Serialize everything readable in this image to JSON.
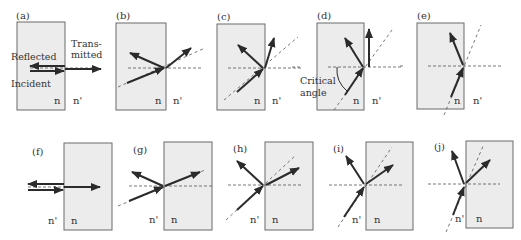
{
  "figure": {
    "colors": {
      "medium_fill": "#ececec",
      "box_stroke": "#6a6a6a",
      "ray": "#2b2b2b",
      "dashed": "#555555",
      "background": "#ffffff"
    },
    "panels": [
      {
        "id": "a",
        "label": "(a)",
        "medium_left": "n",
        "medium_right": "n'",
        "annotations": [
          "Reflected",
          "Trans-",
          "mitted",
          "Incident"
        ]
      },
      {
        "id": "b",
        "label": "(b)",
        "medium_left": "n",
        "medium_right": "n'"
      },
      {
        "id": "c",
        "label": "(c)",
        "medium_left": "n",
        "medium_right": "n'"
      },
      {
        "id": "d",
        "label": "(d)",
        "medium_left": "n",
        "medium_right": "n'",
        "annotations": [
          "Critical",
          "angle"
        ]
      },
      {
        "id": "e",
        "label": "(e)",
        "medium_left": "n",
        "medium_right": "n'"
      },
      {
        "id": "f",
        "label": "(f)",
        "medium_left": "n'",
        "medium_right": "n"
      },
      {
        "id": "g",
        "label": "(g)",
        "medium_left": "n'",
        "medium_right": "n"
      },
      {
        "id": "h",
        "label": "(h)",
        "medium_left": "n'",
        "medium_right": "n"
      },
      {
        "id": "i",
        "label": "(i)",
        "medium_left": "n'",
        "medium_right": "n"
      },
      {
        "id": "j",
        "label": "(j)",
        "medium_left": "n'",
        "medium_right": "n"
      }
    ]
  }
}
